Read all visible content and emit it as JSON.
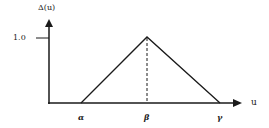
{
  "diagram": {
    "type": "triangular-membership-function",
    "y_axis_label": "Δ(u)",
    "x_axis_label": "u",
    "y_tick_label": "1.0",
    "x_points": {
      "alpha": "α",
      "beta": "β",
      "gamma": "γ"
    },
    "colors": {
      "line": "#1a1a1a",
      "background": "#ffffff"
    }
  }
}
